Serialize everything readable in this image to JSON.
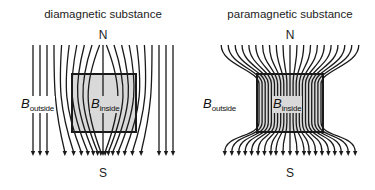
{
  "panels": [
    {
      "id": "diamagnetic",
      "title": "diamagnetic substance",
      "north_label": "N",
      "south_label": "S",
      "b_outside_symbol": "B",
      "b_outside_subscript": "outside",
      "b_inside_symbol": "B",
      "b_inside_subscript": "inside",
      "field_behavior": "lines bow outward, avoiding the substance",
      "line_count": 21
    },
    {
      "id": "paramagnetic",
      "title": "paramagnetic substance",
      "north_label": "N",
      "south_label": "S",
      "b_outside_symbol": "B",
      "b_outside_subscript": "outside",
      "b_inside_symbol": "B",
      "b_inside_subscript": "inside",
      "field_behavior": "lines bend inward, concentrating through the substance",
      "line_count": 21
    }
  ],
  "colors": {
    "line": "#1a1a1a",
    "substance_fill": "#d9d9d9",
    "background": "#ffffff"
  }
}
